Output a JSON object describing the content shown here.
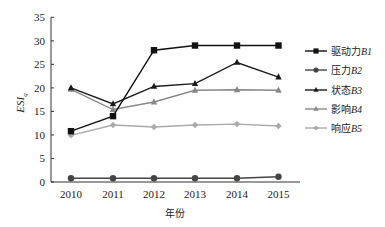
{
  "chart_data": {
    "type": "line",
    "title": "",
    "xlabel": "年份",
    "ylabel": "ESI",
    "ylabel_subscript": "q",
    "x": [
      "2010",
      "2011",
      "2012",
      "2013",
      "2014",
      "2015"
    ],
    "ylim": [
      0,
      35
    ],
    "yticks": [
      0,
      5,
      10,
      15,
      20,
      25,
      30,
      35
    ],
    "grid": false,
    "legend_position": "right",
    "series": [
      {
        "name": "驱动力B1",
        "label_cn": "驱动力",
        "label_code": "B1",
        "marker": "square",
        "color": "#111111",
        "values": [
          10.8,
          14.0,
          28.0,
          29.0,
          29.0,
          29.0
        ]
      },
      {
        "name": "压力B2",
        "label_cn": "压力",
        "label_code": "B2",
        "marker": "circle",
        "color": "#444444",
        "values": [
          0.8,
          0.8,
          0.8,
          0.8,
          0.8,
          1.1
        ]
      },
      {
        "name": "状态B3",
        "label_cn": "状态",
        "label_code": "B3",
        "marker": "triangle",
        "color": "#1a1a1a",
        "values": [
          20.0,
          16.6,
          20.3,
          20.9,
          25.4,
          22.3
        ]
      },
      {
        "name": "影响B4",
        "label_cn": "影响",
        "label_code": "B4",
        "marker": "triangle",
        "color": "#888888",
        "values": [
          19.7,
          15.4,
          17.0,
          19.5,
          19.6,
          19.5
        ]
      },
      {
        "name": "响应B5",
        "label_cn": "响应",
        "label_code": "B5",
        "marker": "diamond",
        "color": "#aaaaaa",
        "values": [
          9.9,
          12.1,
          11.7,
          12.1,
          12.3,
          11.9
        ]
      }
    ]
  }
}
